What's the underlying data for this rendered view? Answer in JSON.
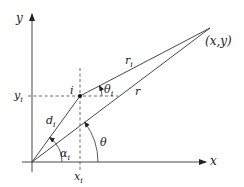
{
  "diagram": {
    "axes": {
      "x_label": "x",
      "y_label": "y"
    },
    "points": {
      "target": {
        "label": "(x,y)"
      },
      "i": {
        "label": "i"
      }
    },
    "segments": {
      "r_i": {
        "label": "r",
        "sub": "i"
      },
      "r": {
        "label": "r"
      },
      "d_i": {
        "label": "d",
        "sub": "i"
      }
    },
    "angles": {
      "theta": {
        "label": "θ"
      },
      "theta_i": {
        "label": "θ",
        "sub": "i"
      },
      "alpha_i": {
        "label": "α",
        "sub": "i"
      }
    },
    "projections": {
      "x_i": {
        "label": "x",
        "sub": "i"
      },
      "y_i": {
        "label": "y",
        "sub": "i"
      }
    },
    "colors": {
      "stroke": "#333333",
      "background": "#ffffff"
    }
  }
}
